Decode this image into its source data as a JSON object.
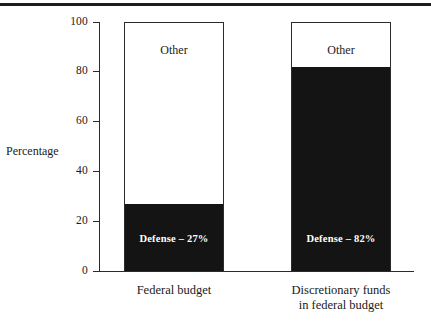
{
  "chart_data": {
    "type": "bar",
    "subtype": "stacked-100-percent",
    "title": "",
    "xlabel": "",
    "ylabel": "Percentage",
    "ylim": [
      0,
      100
    ],
    "ytick_labels": [
      "100",
      "80",
      "60",
      "40",
      "20",
      "0"
    ],
    "yticks": [
      100,
      80,
      60,
      40,
      20,
      0
    ],
    "grid": false,
    "legend": "none",
    "categories": [
      "Federal budget",
      "Discretionary funds in federal budget"
    ],
    "series": [
      {
        "name": "Defense",
        "values": [
          27,
          82
        ],
        "color": "#141414"
      },
      {
        "name": "Other",
        "values": [
          73,
          18
        ],
        "color": "#ffffff"
      }
    ],
    "annotations": [
      "Defense – 27%",
      "Defense – 82%",
      "Other",
      "Other"
    ]
  },
  "axis": {
    "y_title": "Percentage",
    "ticks": [
      {
        "value": 100,
        "label": "100"
      },
      {
        "value": 80,
        "label": "80"
      },
      {
        "value": 60,
        "label": "60"
      },
      {
        "value": 40,
        "label": "40"
      },
      {
        "value": 20,
        "label": "20"
      },
      {
        "value": 0,
        "label": "0"
      }
    ]
  },
  "bars": [
    {
      "id": "federal-budget",
      "category_label_line1": "Federal budget",
      "category_label_line2": "",
      "top_label": "Other",
      "fill_label": "Defense – 27%",
      "fill_percent": 27,
      "other_percent": 73
    },
    {
      "id": "discretionary-funds",
      "category_label_line1": "Discretionary funds",
      "category_label_line2": "in federal budget",
      "top_label": "Other",
      "fill_label": "Defense – 82%",
      "fill_percent": 82,
      "other_percent": 18
    }
  ],
  "colors": {
    "defense_fill": "#141414",
    "other_fill": "#ffffff",
    "axis": "#2b2b2b",
    "text": "#1a1a1a",
    "fill_text": "#ffffff",
    "background": "#ffffff"
  }
}
